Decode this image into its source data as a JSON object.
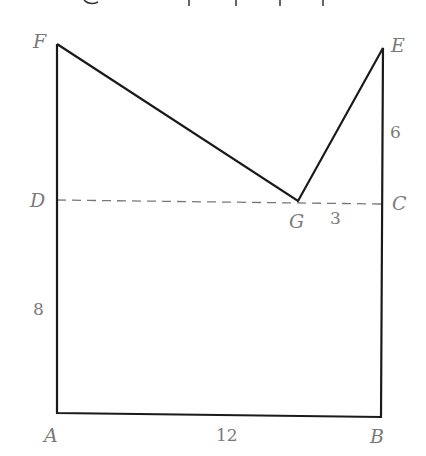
{
  "diagram": {
    "type": "geometry-figure",
    "vertices": {
      "A": {
        "label": "A",
        "x": 55,
        "y": 413
      },
      "B": {
        "label": "B",
        "x": 381,
        "y": 417
      },
      "C": {
        "label": "C",
        "x": 382,
        "y": 203
      },
      "D": {
        "label": "D",
        "x": 56,
        "y": 200
      },
      "E": {
        "label": "E",
        "x": 383,
        "y": 48
      },
      "F": {
        "label": "F",
        "x": 57,
        "y": 44
      },
      "G": {
        "label": "G",
        "x": 298,
        "y": 201
      }
    },
    "edges": [
      {
        "from": "A",
        "to": "B",
        "style": "solid"
      },
      {
        "from": "B",
        "to": "E",
        "style": "solid"
      },
      {
        "from": "E",
        "to": "G",
        "style": "solid"
      },
      {
        "from": "G",
        "to": "F",
        "style": "solid"
      },
      {
        "from": "F",
        "to": "A",
        "style": "solid"
      },
      {
        "from": "D",
        "to": "C",
        "style": "dashed"
      }
    ],
    "measurements": [
      {
        "segment": "AB",
        "value": "12"
      },
      {
        "segment": "CE",
        "value": "6"
      },
      {
        "segment": "GC",
        "value": "3"
      },
      {
        "segment": "AD",
        "value": "8"
      }
    ]
  }
}
